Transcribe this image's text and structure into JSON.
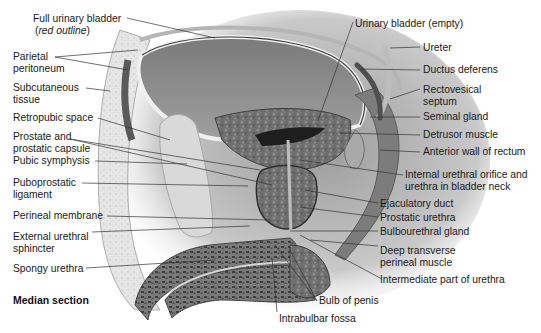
{
  "figure": {
    "caption": "Median section"
  },
  "labels_left": [
    {
      "id": "full-urinary-bladder",
      "line1": "Full urinary bladder",
      "line2_pre": "(",
      "line2_italic": "red outline",
      "line2_post": ")"
    },
    {
      "id": "parietal-peritoneum",
      "line1": "Parietal",
      "line2": "peritoneum"
    },
    {
      "id": "subcutaneous-tissue",
      "line1": "Subcutaneous",
      "line2": "tissue"
    },
    {
      "id": "retropubic-space",
      "line1": "Retropubic space"
    },
    {
      "id": "prostate-capsule",
      "line1": "Prostate and",
      "line2": "prostatic capsule"
    },
    {
      "id": "pubic-symphysis",
      "line1": "Pubic symphysis"
    },
    {
      "id": "puboprostatic-ligament",
      "line1": "Puboprostatic",
      "line2": "ligament"
    },
    {
      "id": "perineal-membrane",
      "line1": "Perineal membrane"
    },
    {
      "id": "external-urethral-sphincter",
      "line1": "External urethral",
      "line2": "sphincter"
    },
    {
      "id": "spongy-urethra",
      "line1": "Spongy urethra"
    }
  ],
  "labels_right": [
    {
      "id": "urinary-bladder-empty",
      "line1": "Urinary bladder (empty)"
    },
    {
      "id": "ureter",
      "line1": "Ureter"
    },
    {
      "id": "ductus-deferens",
      "line1": "Ductus deferens"
    },
    {
      "id": "rectovesical-septum",
      "line1": "Rectovesical",
      "line2": "septum"
    },
    {
      "id": "seminal-gland",
      "line1": "Seminal gland"
    },
    {
      "id": "detrusor-muscle",
      "line1": "Detrusor muscle"
    },
    {
      "id": "anterior-wall-rectum",
      "line1": "Anterior wall of rectum"
    },
    {
      "id": "internal-urethral-orifice",
      "line1": "Internal urethral orifice and",
      "line2": "urethra in bladder neck"
    },
    {
      "id": "ejaculatory-duct",
      "line1": "Ejaculatory duct"
    },
    {
      "id": "prostatic-urethra",
      "line1": "Prostatic urethra"
    },
    {
      "id": "bulbourethral-gland",
      "line1": "Bulbourethral gland"
    },
    {
      "id": "deep-transverse-perineal",
      "line1": "Deep transverse",
      "line2": "perineal muscle"
    },
    {
      "id": "intermediate-urethra",
      "line1": "Intermediate part of urethra"
    }
  ],
  "labels_bottom": [
    {
      "id": "bulb-of-penis",
      "line1": "Bulb of penis"
    },
    {
      "id": "intrabulbar-fossa",
      "line1": "Intrabulbar fossa"
    }
  ],
  "colors": {
    "background": "#ffffff",
    "text": "#1a1a1a",
    "leader": "#333333",
    "bladder_full": "#8c8c8c",
    "bladder_wall": "#d8d8d8",
    "detrusor": "#6e6e6e",
    "prostate": "#4a4a4a",
    "bone": "#d6d6d6",
    "subcutaneous": "#e4e4e4",
    "erectile": "#5a5a5a"
  }
}
